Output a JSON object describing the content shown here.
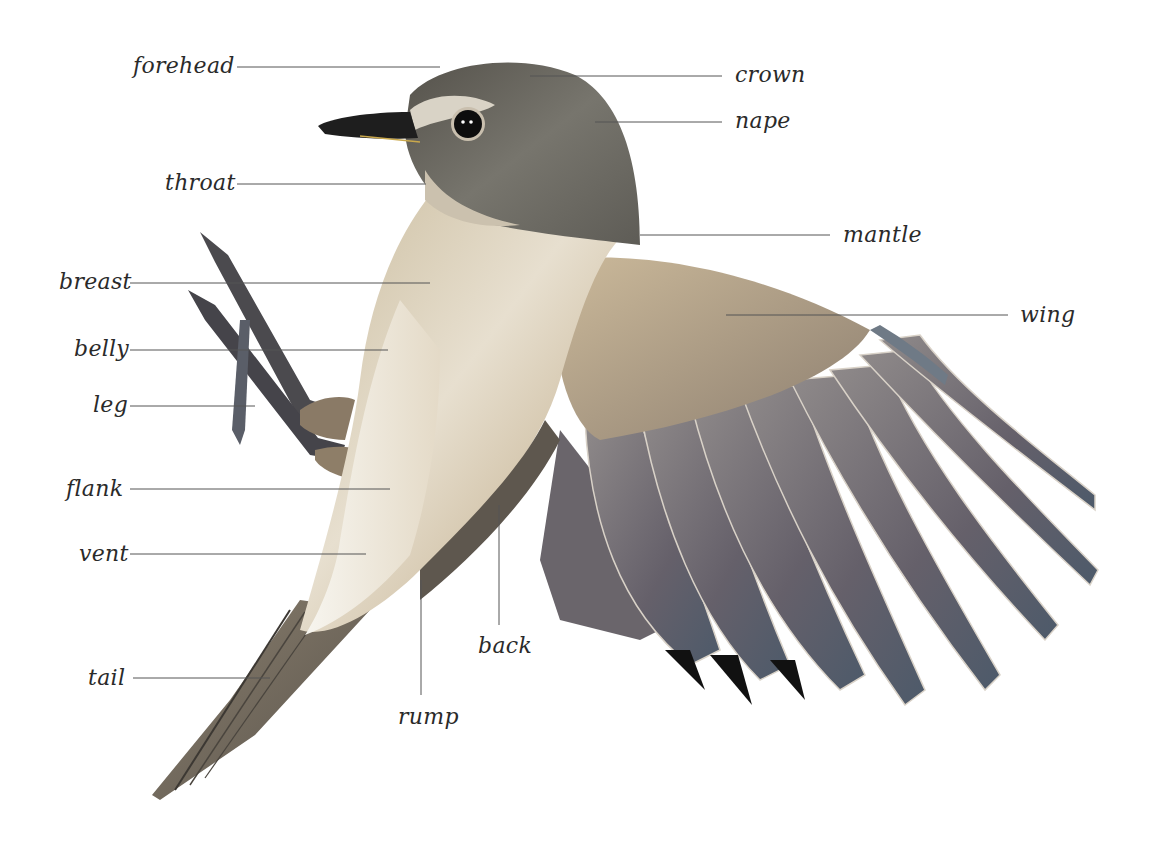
{
  "diagram": {
    "colors": {
      "background": "#ffffff",
      "label_text": "#2a2a2a",
      "leader_line": "#555555",
      "head_grey": "#6f6d66",
      "body_buff": "#d8c9ae",
      "belly_white": "#f2efe8",
      "wing_feather": "#6e6a70",
      "feather_tip_blue": "#5b6a7a",
      "bill": "#1e1e1e"
    },
    "labels": [
      {
        "id": "forehead",
        "text": "forehead",
        "x": 133,
        "y": 55,
        "line": [
          237,
          67,
          440,
          67
        ]
      },
      {
        "id": "crown",
        "text": "crown",
        "x": 735,
        "y": 64,
        "line": [
          530,
          76,
          722,
          76
        ]
      },
      {
        "id": "nape",
        "text": "nape",
        "x": 735,
        "y": 110,
        "line": [
          595,
          122,
          722,
          122
        ]
      },
      {
        "id": "throat",
        "text": "throat",
        "x": 165,
        "y": 172,
        "line": [
          237,
          184,
          426,
          184
        ]
      },
      {
        "id": "mantle",
        "text": "mantle",
        "x": 843,
        "y": 224,
        "line": [
          640,
          235,
          830,
          235
        ]
      },
      {
        "id": "breast",
        "text": "breast",
        "x": 59,
        "y": 271,
        "line": [
          130,
          283,
          430,
          283
        ]
      },
      {
        "id": "wing",
        "text": "wing",
        "x": 1020,
        "y": 304,
        "line": [
          726,
          315,
          1008,
          315
        ]
      },
      {
        "id": "belly",
        "text": "belly",
        "x": 74,
        "y": 338,
        "line": [
          130,
          350,
          388,
          350
        ]
      },
      {
        "id": "leg",
        "text": "leg",
        "x": 93,
        "y": 394,
        "line": [
          130,
          406,
          255,
          406
        ]
      },
      {
        "id": "flank",
        "text": "flank",
        "x": 66,
        "y": 478,
        "line": [
          130,
          489,
          390,
          489
        ]
      },
      {
        "id": "vent",
        "text": "vent",
        "x": 79,
        "y": 543,
        "line": [
          130,
          554,
          366,
          554
        ]
      },
      {
        "id": "back",
        "text": "back",
        "x": 478,
        "y": 635,
        "line": [
          499,
          505,
          499,
          625
        ]
      },
      {
        "id": "tail",
        "text": "tail",
        "x": 88,
        "y": 667,
        "line": [
          133,
          678,
          270,
          678
        ]
      },
      {
        "id": "rump",
        "text": "rump",
        "x": 398,
        "y": 706,
        "line": [
          421,
          580,
          421,
          695
        ]
      }
    ]
  }
}
